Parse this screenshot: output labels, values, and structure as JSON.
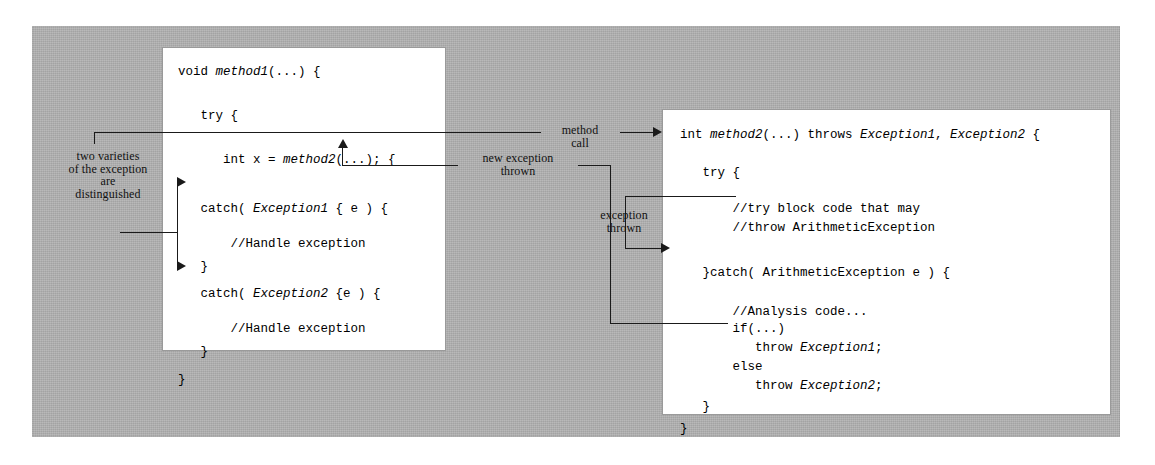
{
  "diagram": {
    "colors": {
      "panel": "#b3b3b3",
      "box": "#ffffff",
      "ink": "#1a1a1a"
    }
  },
  "left_box": {
    "name": "method1-code-box",
    "lines": [
      "void method1(...) {",
      "    try {",
      "        int x = method2(...); {",
      "    catch( Exception1 { e ) {",
      "        //Handle exception",
      "    }",
      "    catch( Exception2 {e ) {",
      "        //Handle exception",
      "    }",
      "}"
    ]
  },
  "right_box": {
    "name": "method2-code-box",
    "lines": [
      "int method2(...) throws Exception1, Exception2 {",
      "    try {",
      "        //try block code that may",
      "        //throw ArithmeticException",
      "    }catch( ArithmeticException e ) {",
      "        //Analysis code...",
      "        if(...)",
      "            throw Exception1;",
      "        else",
      "            throw Exception2;",
      "    }",
      "}"
    ]
  },
  "annotations": {
    "two_varieties": "two varieties\nof the exception\nare\ndistinguished",
    "method_call": "method\ncall",
    "new_exception_thrown": "new exception\nthrown",
    "exception_thrown": "exception\nthrown"
  }
}
